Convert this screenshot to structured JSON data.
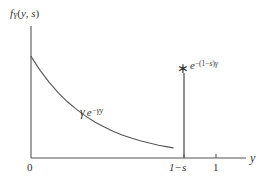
{
  "figure": {
    "type": "probability-density-plot",
    "background_color": "#ffffff",
    "line_color": "#555555",
    "text_color": "#333333"
  },
  "axes": {
    "y_axis_label_parts": {
      "f": "f",
      "subscript": "Y",
      "open": "(",
      "arg1": "y",
      "comma": ", ",
      "arg2": "s",
      "close": ")"
    },
    "y_axis_label_text": "f_Y(y, s)",
    "x_axis_label": "y",
    "x_ticks": [
      {
        "name": "origin",
        "label": "0",
        "value": 0
      },
      {
        "name": "one-minus-s",
        "label": "1−s",
        "value": 0.78
      },
      {
        "name": "one",
        "label": "1",
        "value": 1.0
      }
    ]
  },
  "annotations": {
    "curve": {
      "gamma": "γ",
      "base": "e",
      "superscript": "−γy",
      "full_text": "γ e^{−γy}"
    },
    "atom": {
      "marker": "∗",
      "base": "e",
      "superscript_open": "−(1−",
      "superscript_s": "s",
      "superscript_close": ")",
      "superscript_gamma": "γ",
      "full_text": "e^{−(1−s)γ}"
    }
  },
  "chart_data": {
    "type": "line",
    "title": "",
    "xlabel": "y",
    "ylabel": "f_Y(y, s)",
    "xlim": [
      0,
      1.18
    ],
    "ylim": [
      0,
      1.0
    ],
    "grid": false,
    "legend": null,
    "series": [
      {
        "name": "exponential-density",
        "expression": "γ e^{−γy}",
        "x": [
          0.0,
          0.05,
          0.1,
          0.15,
          0.2,
          0.25,
          0.3,
          0.35,
          0.4,
          0.45,
          0.5,
          0.55,
          0.6,
          0.65,
          0.7,
          0.75,
          0.78
        ],
        "y": [
          0.77,
          0.664,
          0.573,
          0.494,
          0.426,
          0.368,
          0.317,
          0.273,
          0.236,
          0.203,
          0.175,
          0.151,
          0.131,
          0.113,
          0.097,
          0.084,
          0.077
        ]
      }
    ],
    "point_mass": {
      "name": "atom-at-one-minus-s",
      "x": 0.78,
      "x_label": "1−s",
      "height": 0.63,
      "label": "e^{−(1−s)γ}",
      "marker": "∗"
    }
  }
}
